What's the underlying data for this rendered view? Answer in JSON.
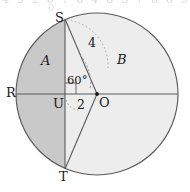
{
  "figure": {
    "colors": {
      "stroke": "#5a5a5a",
      "shade_a": "#c9c9c9",
      "shade_b": "#ededed",
      "text": "#1a1a1a",
      "background": "#ffffff"
    },
    "geometry": {
      "center_label": "O",
      "center_x": 97,
      "center_y": 94,
      "radius_px": 81,
      "chord_x": 65,
      "foot_label": "U"
    },
    "points": {
      "s": {
        "label": "S",
        "x": 55,
        "y": 11
      },
      "t": {
        "label": "T",
        "x": 59,
        "y": 170
      },
      "r": {
        "label": "R",
        "x": 6,
        "y": 86
      },
      "o": {
        "label": "O",
        "x": 99,
        "y": 96
      },
      "u": {
        "label": "U",
        "x": 53,
        "y": 97
      }
    },
    "regions": {
      "a": {
        "label": "A",
        "x": 41,
        "y": 54
      },
      "b": {
        "label": "B",
        "x": 117,
        "y": 53
      }
    },
    "measures": {
      "radius": {
        "label": "4",
        "x": 88,
        "y": 37
      },
      "segment": {
        "label": "2",
        "x": 77,
        "y": 99
      },
      "angle": {
        "label": "60°",
        "x": 67,
        "y": 75
      }
    }
  },
  "artifact": {
    "line1": "4 3 2 6 7 8 4 8 3 7 8 6 9",
    "line2": "0"
  }
}
